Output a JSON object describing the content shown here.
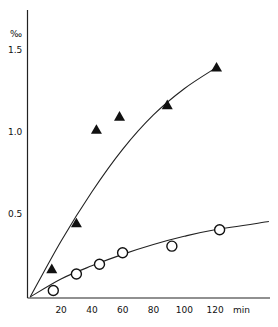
{
  "chart_data": {
    "type": "scatter",
    "title": "",
    "xlabel": "min",
    "ylabel": "‰",
    "xlim": [
      0,
      155
    ],
    "ylim": [
      0,
      1.75
    ],
    "x_ticks": [
      20,
      40,
      60,
      80,
      100,
      120
    ],
    "x_tick_labels": [
      "20",
      "40",
      "60",
      "80",
      "100",
      "120"
    ],
    "y_ticks": [
      0.5,
      1.0,
      1.5
    ],
    "y_tick_labels": [
      "0.5",
      "1.0",
      "1.5"
    ],
    "grid": false,
    "legend": null,
    "series": [
      {
        "name": "filled triangles",
        "marker": "triangle-filled",
        "x": [
          14,
          30,
          43,
          58,
          89,
          121
        ],
        "y": [
          0.17,
          0.45,
          1.02,
          1.1,
          1.17,
          1.4
        ]
      },
      {
        "name": "open circles",
        "marker": "circle-open",
        "x": [
          15,
          30,
          45,
          60,
          92,
          123
        ],
        "y": [
          0.04,
          0.14,
          0.2,
          0.27,
          0.31,
          0.41
        ]
      }
    ],
    "fitted_curves": [
      {
        "name": "triangle fit",
        "x": [
          0,
          20,
          40,
          60,
          80,
          100,
          121
        ],
        "y": [
          0,
          0.34,
          0.64,
          0.9,
          1.11,
          1.27,
          1.4
        ]
      },
      {
        "name": "circle fit",
        "x": [
          0,
          20,
          40,
          60,
          80,
          100,
          120,
          155
        ],
        "y": [
          0,
          0.11,
          0.19,
          0.26,
          0.32,
          0.37,
          0.41,
          0.46
        ]
      }
    ]
  },
  "axes": {
    "y_unit": "‰",
    "x_unit": "min"
  }
}
